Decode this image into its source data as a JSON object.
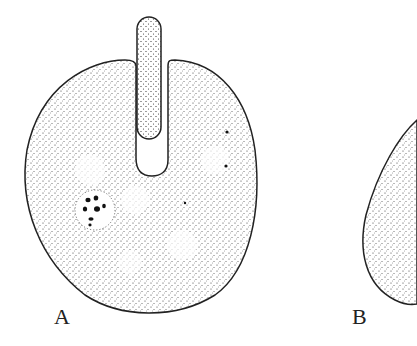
{
  "figure": {
    "panels": [
      {
        "label": "A",
        "description": "stippled round cell with elongated tubular process inserted from top"
      },
      {
        "label": "B",
        "description": "stippled round cell, partially cropped at right edge"
      }
    ],
    "colors": {
      "ink": "#222222",
      "background": "#ffffff"
    }
  }
}
